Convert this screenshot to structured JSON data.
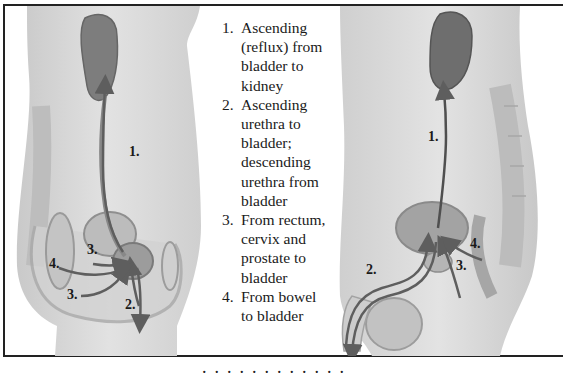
{
  "figure": {
    "left_panel": {
      "title": "Female pelvis sagittal view",
      "labels": [
        {
          "id": "1",
          "text": "1.",
          "x": 124,
          "y": 150
        },
        {
          "id": "3a",
          "text": "3.",
          "x": 82,
          "y": 248
        },
        {
          "id": "4",
          "text": "4.",
          "x": 44,
          "y": 262
        },
        {
          "id": "3b",
          "text": "3.",
          "x": 62,
          "y": 293
        },
        {
          "id": "2",
          "text": "2.",
          "x": 120,
          "y": 303
        }
      ]
    },
    "right_panel": {
      "title": "Male pelvis sagittal view",
      "labels": [
        {
          "id": "1",
          "text": "1.",
          "x": 425,
          "y": 139
        },
        {
          "id": "4",
          "text": "4.",
          "x": 467,
          "y": 246
        },
        {
          "id": "2",
          "text": "2.",
          "x": 364,
          "y": 272
        },
        {
          "id": "3",
          "text": "3.",
          "x": 453,
          "y": 268
        }
      ]
    },
    "legend": {
      "items": [
        {
          "num": "1.",
          "text": "Ascending (reflux) from bladder to kidney"
        },
        {
          "num": "2.",
          "text": "Ascending urethra to bladder; descending urethra from bladder"
        },
        {
          "num": "3.",
          "text": "From rectum, cervix and prostate to bladder"
        },
        {
          "num": "4.",
          "text": "From bowel to bladder"
        }
      ]
    },
    "caption": "· · · · · · · · · · · ·",
    "colors": {
      "border": "#222222",
      "arrow": "#6b6b6b",
      "organ_dark": "#7a7a7a",
      "body_light": "#d6d6d6",
      "text": "#1a1a1a"
    }
  }
}
